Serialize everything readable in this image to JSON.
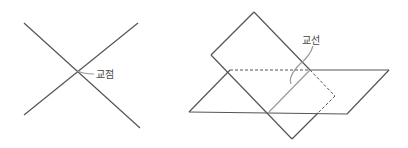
{
  "diagram": {
    "left_figure": {
      "description": "two intersecting lines",
      "label": "교점",
      "colors": {
        "line": "#555555",
        "leader": "#9a9a9a"
      }
    },
    "right_figure": {
      "description": "two intersecting planes",
      "label": "교선",
      "colors": {
        "line": "#555555",
        "intersection": "#9a9a9a"
      }
    }
  }
}
